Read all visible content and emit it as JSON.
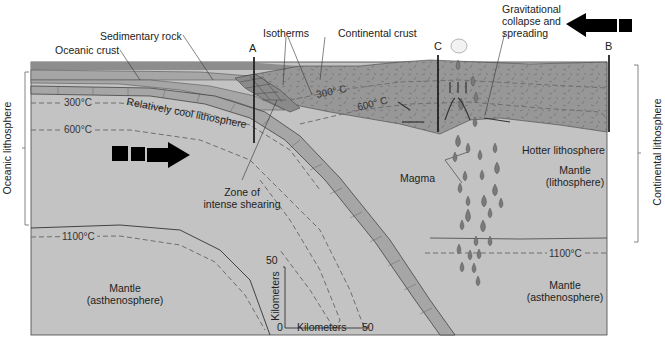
{
  "colors": {
    "mantle": "#c3c3c3",
    "oceanic_crust": "#a6a6a6",
    "continental_crust": "#979797",
    "sea_layer": "#8d8d8d",
    "outline": "#333333",
    "dashed_isotherm": "#6e6e6e",
    "magma": "#7a7a7a"
  },
  "labels": {
    "oceanic_crust": "Oceanic crust",
    "sedimentary_rock": "Sedimentary rock",
    "isotherms": "Isotherms",
    "continental_crust": "Continental crust",
    "gravitational": "Gravitational",
    "collapse_and": "collapse and",
    "spreading": "spreading",
    "relatively_cool": "Relatively cool lithosphere",
    "zone_line1": "Zone of",
    "zone_line2": "intense shearing",
    "magma": "Magma",
    "hotter_lithosphere": "Hotter lithosphere",
    "mantle_lith_line1": "Mantle",
    "mantle_lith_line2": "(lithosphere)",
    "mantle_asth_left_line1": "Mantle",
    "mantle_asth_left_line2": "(asthenosphere)",
    "mantle_asth_right_line1": "Mantle",
    "mantle_asth_right_line2": "(asthenosphere)",
    "oceanic_lithosphere": "Oceanic lithosphere",
    "continental_lithosphere": "Continental lithosphere"
  },
  "section_markers": {
    "a": "A",
    "b": "B",
    "c": "C"
  },
  "isotherms": {
    "left_300": "300°C",
    "left_600": "600°C",
    "left_1100": "1100°C",
    "cont_300": "300° C",
    "cont_600": "600° C",
    "right_1100": "1100°C"
  },
  "scale": {
    "vertical_max": "50",
    "vertical_label": "Kilometers",
    "origin": "0",
    "horizontal_label": "Kilometers",
    "horizontal_max": "50"
  },
  "arrows": {
    "left_plate_direction": "right",
    "right_plate_direction": "left"
  }
}
